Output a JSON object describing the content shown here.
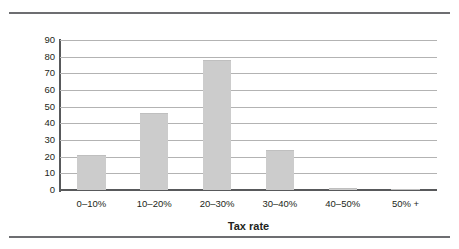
{
  "chart_data": {
    "type": "bar",
    "title": "",
    "subtitle": "",
    "xlabel": "Tax rate",
    "ylabel": "Number of countries",
    "categories": [
      "0–10%",
      "10–20%",
      "20–30%",
      "30–40%",
      "40–50%",
      "50% +"
    ],
    "values": [
      21,
      46,
      78,
      24,
      1,
      0
    ],
    "ylim": [
      0,
      90
    ],
    "yticks": [
      0,
      10,
      20,
      30,
      40,
      50,
      60,
      70,
      80,
      90
    ],
    "ytick_labels": [
      "0",
      "10",
      "20",
      "30",
      "40",
      "50",
      "60",
      "70",
      "80",
      "90"
    ],
    "grid": true,
    "legend": false,
    "bar_color": "#cccccc",
    "gridline_color": "#b3b3b3",
    "axis_color": "#58595b",
    "text_color": "#231f20",
    "rule_color": "#6d6e71"
  }
}
